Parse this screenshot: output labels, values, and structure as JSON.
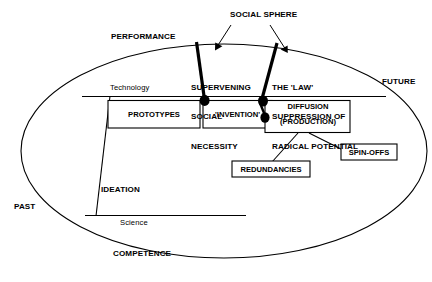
{
  "diagram": {
    "title_label": "SOCIAL SPHERE",
    "axis_labels": {
      "performance": "PERFORMANCE",
      "competence": "COMPETENCE",
      "past": "PAST",
      "future": "FUTURE"
    },
    "band_labels": {
      "technology": "Technology",
      "science": "Science",
      "ideation": "IDEATION"
    },
    "force_labels": {
      "supervening": "SUPERVENING\nSOCIAL\nNECESSITY",
      "supervening_lines": [
        "SUPERVENING",
        "SOCIAL",
        "NECESSITY"
      ],
      "law": "THE 'LAW'\nSUPPRESSION OF\nRADICAL POTENTIAL",
      "law_lines": [
        "THE 'LAW'",
        "SUPPRESSION OF",
        "RADICAL POTENTIAL"
      ]
    },
    "stage_boxes": [
      {
        "id": "prototypes",
        "label": "PROTOTYPES"
      },
      {
        "id": "invention",
        "label": "'INVENTION'"
      },
      {
        "id": "diffusion",
        "label_line1": "DIFFUSION",
        "label_line2": "(PRODUCTION)"
      }
    ],
    "outcome_boxes": [
      {
        "id": "redundancies",
        "label": "REDUNDANCIES"
      },
      {
        "id": "spinoffs",
        "label": "SPIN-OFFS"
      }
    ],
    "colors": {
      "stroke": "#000000",
      "background": "#ffffff",
      "blob": "#000000"
    }
  }
}
